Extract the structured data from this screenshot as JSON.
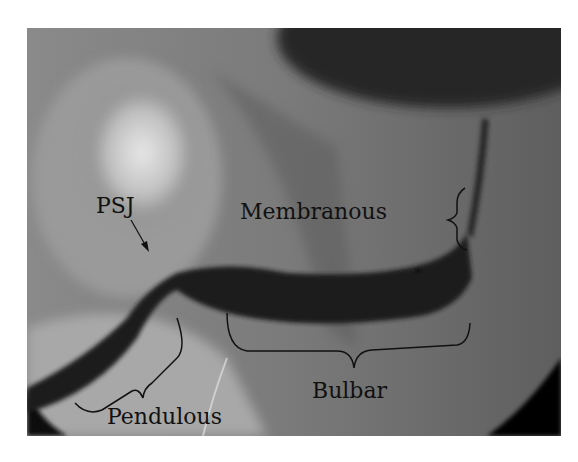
{
  "figure": {
    "type": "retrograde urethrogram (fluoroscopy)",
    "labels": {
      "psj": "PSJ",
      "membranous": "Membranous",
      "bulbar": "Bulbar",
      "pendulous": "Pendulous",
      "marker": "*"
    },
    "colors": {
      "background_dark": "#3a3a3a",
      "contrast_urethra": "#1a1a1a",
      "bone_bright": "#d8d8d8",
      "soft_tissue": "#6a6a6a",
      "annotation": "#111111"
    }
  }
}
